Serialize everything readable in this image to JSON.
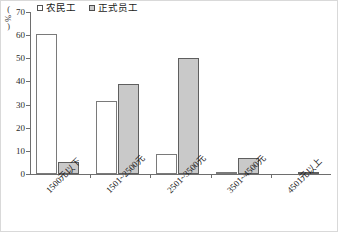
{
  "chart_data": {
    "type": "bar",
    "title": "",
    "xlabel": "",
    "ylabel": "%",
    "ylim": [
      0,
      70
    ],
    "yticks": [
      0,
      10,
      20,
      30,
      40,
      50,
      60,
      70
    ],
    "grid": false,
    "legend_position": "top-left",
    "categories": [
      "1500元以下",
      "1501~2500元",
      "2501~3500元",
      "3501~4500元",
      "4501元以上"
    ],
    "series": [
      {
        "name": "农民工",
        "style": "hollow",
        "values": [
          60.5,
          31.5,
          8.5,
          0.5,
          0
        ]
      },
      {
        "name": "正式员工",
        "style": "solid",
        "values": [
          5,
          39,
          50,
          7,
          1
        ]
      }
    ]
  },
  "axis": {
    "unit_open_paren": "(",
    "unit_symbol": "%",
    "unit_close_paren": ")"
  },
  "colors": {
    "hollow_fill": "#ffffff",
    "solid_fill": "#c9c9c9",
    "bar_border": "#7a7a7a",
    "axis": "#6e6e6e",
    "text": "#1a1a1a"
  }
}
